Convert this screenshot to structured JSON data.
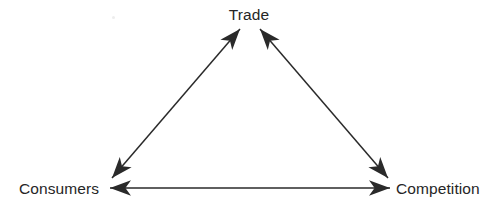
{
  "diagram": {
    "background_color": "#ffffff",
    "line_color": "#2a2a2a",
    "text_color": "#262626",
    "nodes": [
      {
        "id": "trade",
        "label": "Trade",
        "position": "top-center",
        "x": 250,
        "y": 15
      },
      {
        "id": "consumers",
        "label": "Consumers",
        "position": "bottom-left",
        "x": 60,
        "y": 188
      },
      {
        "id": "competition",
        "label": "Competition",
        "position": "bottom-right",
        "x": 440,
        "y": 188
      }
    ],
    "edges": [
      {
        "id": "consumers-trade",
        "from": "consumers",
        "to": "trade",
        "style": "double-arrow",
        "orientation": "diagonal-left"
      },
      {
        "id": "trade-competition",
        "from": "trade",
        "to": "competition",
        "style": "double-arrow",
        "orientation": "diagonal-right"
      },
      {
        "id": "consumers-competition",
        "from": "consumers",
        "to": "competition",
        "style": "double-arrow",
        "orientation": "horizontal"
      }
    ],
    "marks": [
      {
        "id": "speck",
        "type": "faint-dot",
        "x": 113,
        "y": 17
      }
    ]
  }
}
